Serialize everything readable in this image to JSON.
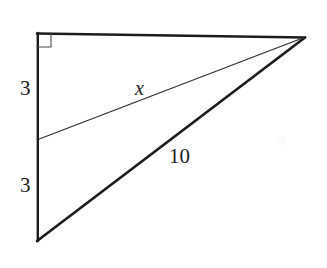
{
  "figure": {
    "background_color": "#ffffff",
    "stroke_color": "#1c1c1c",
    "width": 327,
    "height": 268
  },
  "labels": {
    "leg_upper": "3",
    "leg_lower": "3",
    "hypotenuse_thin": "x",
    "hypotenuse_thick": "10"
  },
  "geometry": {
    "vertices": {
      "top_left": {
        "x": 37,
        "y": 33
      },
      "bottom_left": {
        "x": 37,
        "y": 241
      },
      "apex_right": {
        "x": 305,
        "y": 37
      },
      "cevian_foot": {
        "x": 38,
        "y": 139
      }
    },
    "right_angle_marker": {
      "at": "top_left",
      "size": 13,
      "stroke_width": 1.1
    },
    "segments": [
      {
        "name": "top-edge",
        "from": "top_left",
        "to": "apex_right",
        "weight": "thick"
      },
      {
        "name": "left-leg",
        "from": "top_left",
        "to": "bottom_left",
        "weight": "thick"
      },
      {
        "name": "hypotenuse",
        "from": "bottom_left",
        "to": "apex_right",
        "weight": "thick"
      },
      {
        "name": "cevian",
        "from": "cevian_foot",
        "to": "apex_right",
        "weight": "thin"
      }
    ],
    "stroke_widths": {
      "thick": 2.6,
      "thin": 1.0
    }
  }
}
